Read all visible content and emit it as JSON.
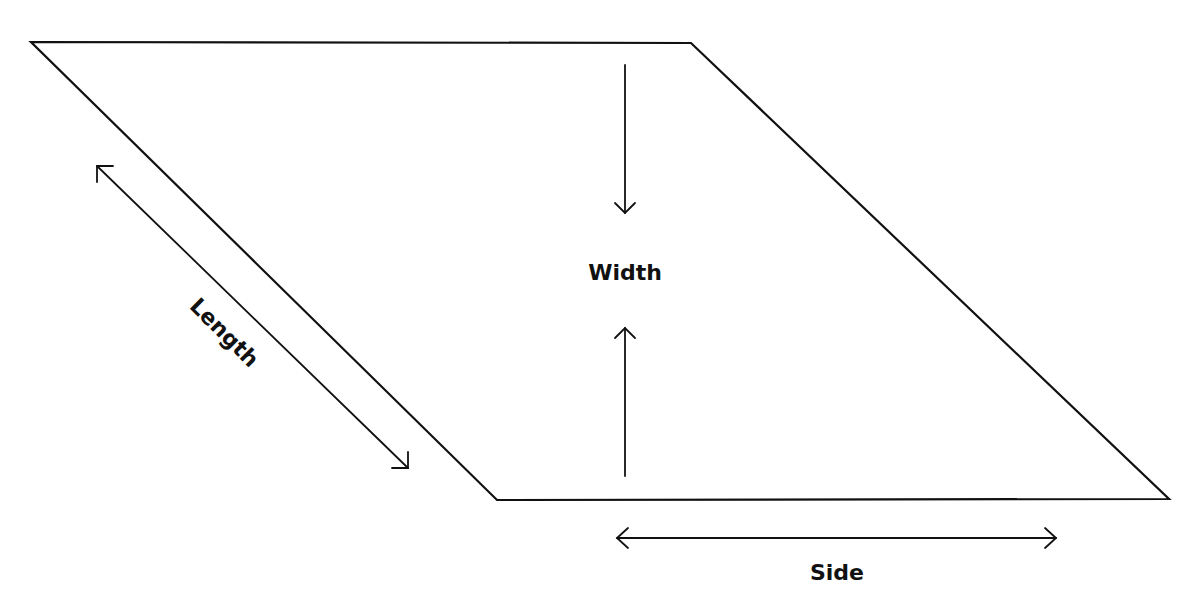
{
  "diagram": {
    "type": "parallelogram-dimensions",
    "background": "#ffffff",
    "stroke_color": "#111111",
    "shape": {
      "name": "parallelogram",
      "vertices": [
        [
          31,
          42
        ],
        [
          691,
          43
        ],
        [
          1169,
          499
        ],
        [
          497,
          500
        ]
      ]
    },
    "labels": {
      "width": "Width",
      "length": "Length",
      "side": "Side"
    },
    "arrows": [
      {
        "name": "length-arrow",
        "type": "double",
        "from": [
          97,
          166
        ],
        "to": [
          408,
          468
        ]
      },
      {
        "name": "width-arrow-down",
        "type": "single",
        "from": [
          625,
          65
        ],
        "to": [
          625,
          213
        ]
      },
      {
        "name": "width-arrow-up",
        "type": "single",
        "from": [
          625,
          476
        ],
        "to": [
          625,
          328
        ]
      },
      {
        "name": "side-arrow",
        "type": "double",
        "from": [
          617,
          538
        ],
        "to": [
          1056,
          538
        ]
      }
    ]
  }
}
